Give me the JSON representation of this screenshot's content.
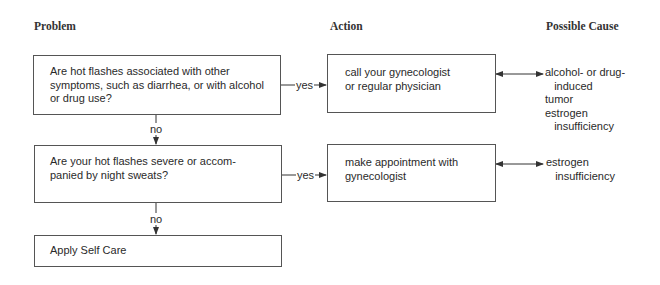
{
  "headers": {
    "problem": "Problem",
    "action": "Action",
    "cause": "Possible Cause"
  },
  "problems": [
    {
      "text": "Are hot flashes associated with other\nsymptoms, such as diarrhea, or with alcohol\nor drug use?"
    },
    {
      "text": "Are your hot flashes severe or accom-\npanied by night sweats?"
    },
    {
      "text": "Apply Self Care"
    }
  ],
  "actions": [
    {
      "text": "call your gynecologist\nor regular physician"
    },
    {
      "text": "make appointment with\ngynecologist"
    }
  ],
  "causes": [
    {
      "text": "alcohol- or drug-\n   induced\ntumor\nestrogen\n   insufficiency"
    },
    {
      "text": "estrogen\n   insufficiency"
    }
  ],
  "edge_labels": {
    "yes": "yes",
    "no": "no"
  }
}
